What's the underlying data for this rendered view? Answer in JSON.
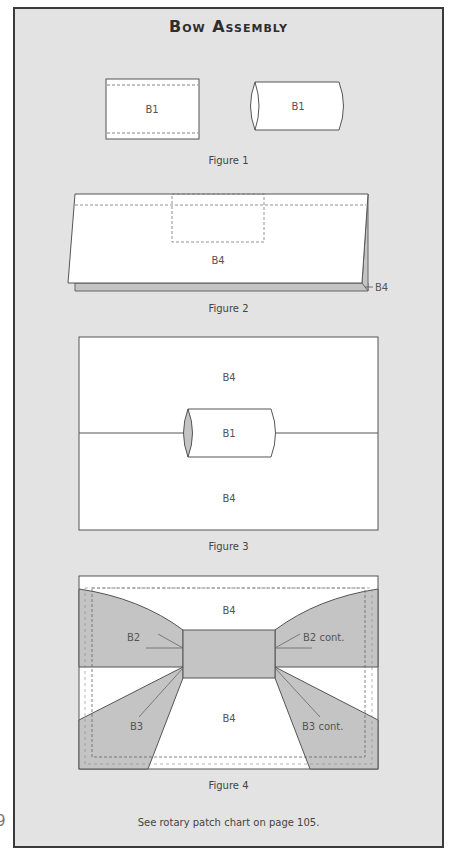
{
  "page": {
    "page_number_fragment": "9",
    "title": "Bow Assembly",
    "footer_note": "See rotary patch chart on page 105.",
    "colors": {
      "panel_bg": "#e3e3e3",
      "panel_border": "#3a3a3a",
      "fabric_white": "#ffffff",
      "fabric_gray": "#c4c4c4",
      "outline": "#555555"
    }
  },
  "figures": [
    {
      "caption": "Figure 1",
      "labels": {
        "flat_piece": "B1",
        "tube_piece": "B1"
      }
    },
    {
      "caption": "Figure 2",
      "labels": {
        "front_piece": "B4",
        "back_piece": "B4"
      }
    },
    {
      "caption": "Figure 3",
      "labels": {
        "top_piece": "B4",
        "center_tube": "B1",
        "bottom_piece": "B4"
      }
    },
    {
      "caption": "Figure 4",
      "labels": {
        "top_piece": "B4",
        "bottom_piece": "B4",
        "left_upper_wing": "B2",
        "right_upper_wing": "B2 cont.",
        "left_lower_wing": "B3",
        "right_lower_wing": "B3 cont."
      }
    }
  ]
}
